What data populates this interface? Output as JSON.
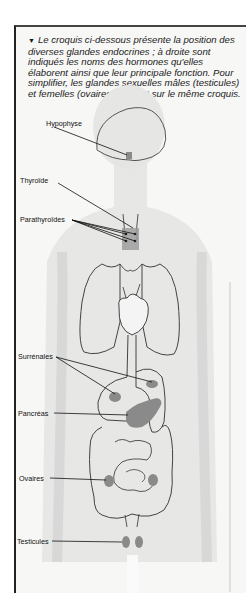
{
  "caption": {
    "marker": "▼",
    "text": "Le croquis ci-dessous présente la position des diverses glandes endocrines ; à droite sont indiqués les noms des hormones qu'elles élaborent ainsi que leur principale fonction. Pour simplifier, les glandes sexuelles mâles (testicules) et femelles (ovaires) figurent sur le même croquis."
  },
  "labels": {
    "hypophyse": "Hypophyse",
    "thyroide": "Thyroïde",
    "parathyroides": "Parathyroïdes",
    "surrenales": "Surrénales",
    "pancreas": "Pancréas",
    "ovaires": "Ovaires",
    "testicules": "Testicules"
  },
  "colors": {
    "gland": "#8a8a8a",
    "outline": "#333333",
    "body_shade": "#dcdcdc"
  }
}
